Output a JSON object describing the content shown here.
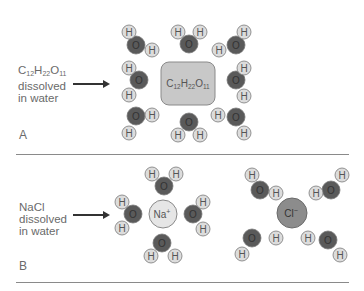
{
  "panels": {
    "a": {
      "letter": "A",
      "label_formula": "C",
      "label_line2": "dissolved",
      "label_line3": "in water",
      "label_formula_parts": [
        "C",
        "12",
        "H",
        "22",
        "O",
        "11"
      ],
      "solute": {
        "name": "C12H22O11",
        "parts": [
          "C",
          "12",
          "H",
          "22",
          "O",
          "11"
        ],
        "shape": "rounded-square",
        "fill": "#c8c8c8"
      }
    },
    "b": {
      "letter": "B",
      "label_line1": "NaCl",
      "label_line2": "dissolved",
      "label_line3": "in water",
      "cation": {
        "symbol": "Na",
        "charge": "+",
        "fill": "#e6e6e6"
      },
      "anion": {
        "symbol": "Cl",
        "charge": "−",
        "fill": "#8c8c8c"
      }
    }
  },
  "atoms": {
    "oxygen": {
      "symbol": "O",
      "fill": "#5a5a5a"
    },
    "hydrogen": {
      "symbol": "H",
      "fill": "#dcdcdc"
    }
  },
  "colors": {
    "text": "#6a6a6a",
    "divider": "#8a8a8a",
    "arrow": "#333333"
  }
}
